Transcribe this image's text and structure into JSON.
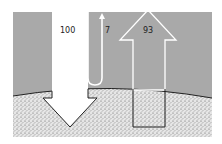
{
  "diagram": {
    "type": "energy-balance",
    "labels": {
      "incoming": "100",
      "reflected": "7",
      "emitted": "93"
    },
    "colors": {
      "atmosphere": "#a9a9a9",
      "ground_fill": "#e2e2e2",
      "ground_dots": "#6a6a6a",
      "arrow_fill": "#ffffff",
      "outline": "#222222"
    }
  }
}
